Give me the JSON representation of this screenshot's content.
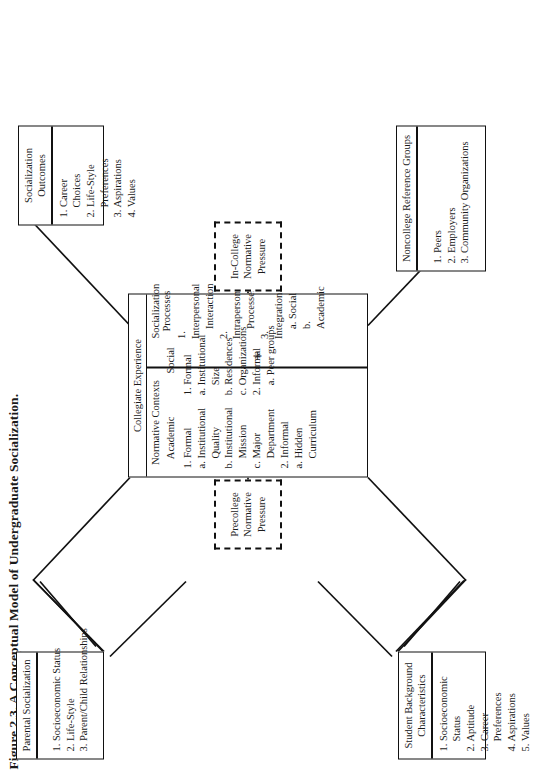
{
  "figure": {
    "title": "Figure 2.3. A Conceptual Model of Undergraduate Socialization.",
    "accent": "#111111",
    "background": "#ffffff"
  },
  "boxes": {
    "parental": {
      "header": "Parental Socialization",
      "items": [
        "1. Socioeconomic Status",
        "2. Life-Style",
        "3. Parent/Child Relationships"
      ]
    },
    "student": {
      "header": "Student Background Characteristics",
      "items": [
        "1. Socioeconomic",
        "Status",
        "2. Aptitude",
        "3. Career",
        "Preferences",
        "4. Aspirations",
        "5. Values"
      ]
    },
    "outcomes": {
      "header": "Socialization Outcomes",
      "items": [
        "1. Career",
        "Choices",
        "2. Life-Style",
        "Preferences",
        "3. Aspirations",
        "4. Values"
      ]
    },
    "noncollege": {
      "header": "Noncollege Reference Groups",
      "items": [
        "1. Peers",
        "2. Employers",
        "3. Community Organizations"
      ]
    }
  },
  "dashed": {
    "precollege": "Precollege Normative Pressure",
    "incollege": "In-College Normative Pressure"
  },
  "center": {
    "header": "Collegiate Experience",
    "normative_contexts": {
      "title": "Normative Contexts",
      "academic": {
        "subtitle": "Academic",
        "items": [
          "1. Formal",
          "a. Institutional",
          "Quality",
          "b. Institutional",
          "Mission",
          "c. Major",
          "Department",
          "2. Informal",
          "a. Hidden",
          "Curriculum"
        ]
      },
      "social": {
        "subtitle": "Social",
        "items": [
          "1. Formal",
          "a. Institutional",
          "Size",
          "b. Residences",
          "c. Organizations",
          "2. Informal",
          "a. Peer groups"
        ]
      }
    },
    "socialization_processes": {
      "title": "Socialization Processes",
      "items": [
        "1. Interpersonal",
        "Interaction",
        "2. Intrapersonal",
        "Processes",
        "3. Integration",
        "a. Social",
        "b. Academic"
      ]
    },
    "plus_symbol": "+"
  }
}
